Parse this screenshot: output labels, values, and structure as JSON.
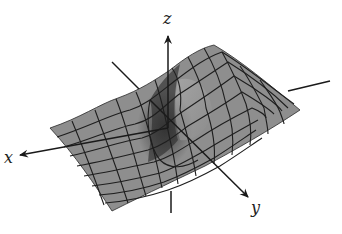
{
  "figure": {
    "type": "3d-surface-plot",
    "colors": {
      "background": "#ffffff",
      "surface_fill": "#8c8c8c",
      "surface_dark": "#4a4a4a",
      "surface_light": "#a9a9a9",
      "grid_lines": "#1e1e1e",
      "axes": "#1a1a1a"
    },
    "axes": {
      "x": {
        "label": "x"
      },
      "y": {
        "label": "y"
      },
      "z": {
        "label": "z"
      }
    },
    "grid": {
      "rows": 9,
      "cols": 12
    }
  }
}
